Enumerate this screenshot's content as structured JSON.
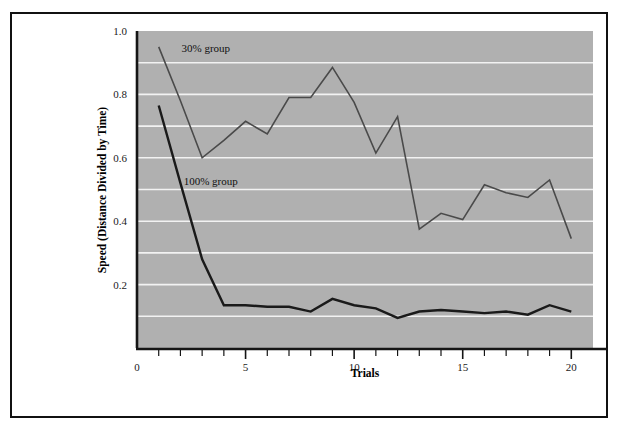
{
  "figure": {
    "plot_background_color": "#b0b0b0",
    "gridline_color": "#f2f2f2",
    "axis_color": "#151515",
    "frame_color": "#111111"
  },
  "chart_data": {
    "type": "line",
    "title": "",
    "xlabel": "Trials",
    "ylabel": "Speed (Distance Divided by Time)",
    "xlim": [
      0,
      21
    ],
    "ylim": [
      0,
      1.0
    ],
    "x": [
      1,
      2,
      3,
      4,
      5,
      6,
      7,
      8,
      9,
      10,
      11,
      12,
      13,
      14,
      15,
      16,
      17,
      18,
      19,
      20
    ],
    "xticks": [
      0,
      5,
      10,
      15,
      20
    ],
    "xtick_labels": [
      "0",
      "5",
      "10",
      "15",
      "20"
    ],
    "xminor_ticks": [
      1,
      2,
      3,
      4,
      6,
      7,
      8,
      9,
      11,
      12,
      13,
      14,
      16,
      17,
      18,
      19
    ],
    "yticks": [
      0.2,
      0.4,
      0.6,
      0.8,
      1.0
    ],
    "ytick_labels": [
      "0.2",
      "0.4",
      "0.6",
      "0.8",
      "1.0"
    ],
    "ygridlines": [
      0.1,
      0.2,
      0.3,
      0.4,
      0.5,
      0.6,
      0.7,
      0.8,
      0.9
    ],
    "grid": true,
    "legend_position": "inline-annotation",
    "series": [
      {
        "name": "30% group",
        "label_text": "30% group",
        "label_x": 2.05,
        "label_y": 0.935,
        "color": "#4a4a4a",
        "line_width": 1.6,
        "values": [
          0.95,
          0.78,
          0.6,
          0.655,
          0.715,
          0.675,
          0.79,
          0.79,
          0.885,
          0.775,
          0.615,
          0.73,
          0.375,
          0.425,
          0.405,
          0.515,
          0.49,
          0.475,
          0.53,
          0.345
        ]
      },
      {
        "name": "100% group",
        "label_text": "100% group",
        "label_x": 2.15,
        "label_y": 0.515,
        "color": "#1a1a1a",
        "line_width": 2.4,
        "values": [
          0.765,
          0.52,
          0.28,
          0.135,
          0.135,
          0.13,
          0.13,
          0.115,
          0.155,
          0.135,
          0.125,
          0.095,
          0.115,
          0.12,
          0.115,
          0.11,
          0.115,
          0.105,
          0.135,
          0.115
        ]
      }
    ]
  }
}
